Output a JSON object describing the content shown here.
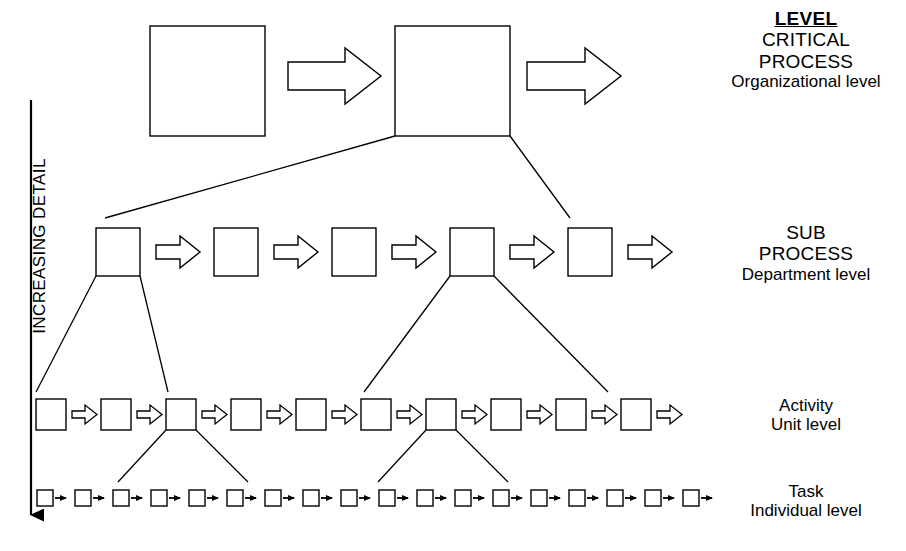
{
  "diagram": {
    "title_text": "Process hierarchy",
    "axis": {
      "label": "INCREASING DETAIL",
      "direction": "down",
      "arrow_name": "increasing-detail-arrow"
    },
    "legend_column_heading": "LEVEL",
    "levels": [
      {
        "id": "critical-process",
        "line1": "CRITICAL",
        "line2": "PROCESS",
        "scope": "Organizational level",
        "box_count": 2,
        "box_size": 105,
        "arrow_style": "large-hollow-block"
      },
      {
        "id": "sub-process",
        "line1": "SUB",
        "line2": "PROCESS",
        "scope": "Department level",
        "box_count": 5,
        "box_size": 42,
        "arrow_style": "medium-hollow-block"
      },
      {
        "id": "activity",
        "line1": "Activity",
        "line2": "",
        "scope": "Unit level",
        "box_count": 12,
        "box_size": 27,
        "arrow_style": "small-hollow-block"
      },
      {
        "id": "task",
        "line1": "Task",
        "line2": "",
        "scope": "Individual level",
        "box_count": 17,
        "box_size": 14,
        "arrow_style": "tiny-solid-arrow"
      }
    ],
    "colors": {
      "background": "#ffffff",
      "stroke": "#000000",
      "box_fill": "#ffffff"
    },
    "decomposition": {
      "critical_to_sub": "box 2 of critical-process expands into the 5 sub-process boxes",
      "sub_to_activity": "sub-process boxes 1 and 4 expand into activity boxes",
      "activity_to_task": "activity boxes 3 and 7 expand into task boxes"
    }
  }
}
